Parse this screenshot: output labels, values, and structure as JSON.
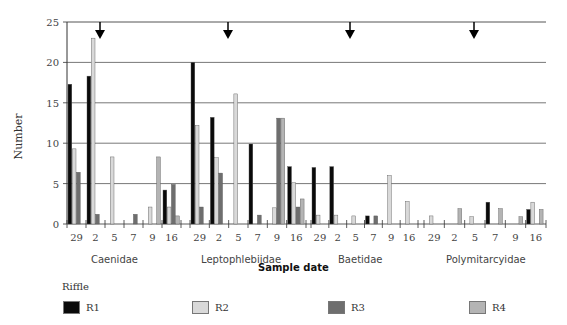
{
  "chart_data": {
    "type": "bar",
    "title": "",
    "xlabel": "Sample date",
    "ylabel": "Number",
    "ylim": [
      0,
      25
    ],
    "yticks": [
      0,
      5,
      10,
      15,
      20,
      25
    ],
    "grid": true,
    "legend": {
      "title": "Riffle",
      "position": "bottom",
      "entries": [
        "R1",
        "R2",
        "R3",
        "R4"
      ]
    },
    "series_colors": {
      "R1": "#0a0a0a",
      "R2": "#d9d9d9",
      "R3": "#6e6e6e",
      "R4": "#b4b4b4"
    },
    "annotations": [
      {
        "type": "arrow-down",
        "group": "Caenidae",
        "near_date": "2"
      },
      {
        "type": "arrow-down",
        "group": "Leptophlebiidae",
        "near_date": "2"
      },
      {
        "type": "arrow-down",
        "group": "Baetidae",
        "near_date": "2"
      },
      {
        "type": "arrow-down",
        "group": "Polymitarcyidae",
        "near_date": "2"
      }
    ],
    "groups": [
      {
        "name": "Caenidae",
        "dates": [
          "29",
          "2",
          "5",
          "7",
          "9",
          "16"
        ],
        "series": [
          {
            "name": "R1",
            "values": [
              17.3,
              18.3,
              0,
              0,
              0,
              4.2
            ]
          },
          {
            "name": "R2",
            "values": [
              9.3,
              23,
              8.3,
              0,
              2.1,
              2.1
            ]
          },
          {
            "name": "R3",
            "values": [
              6.4,
              1.2,
              0,
              1.2,
              0,
              4.9
            ]
          },
          {
            "name": "R4",
            "values": [
              0,
              0,
              0,
              0,
              8.3,
              1.0
            ]
          }
        ]
      },
      {
        "name": "Leptophlebiidae",
        "dates": [
          "29",
          "2",
          "5",
          "7",
          "9",
          "16"
        ],
        "series": [
          {
            "name": "R1",
            "values": [
              20,
              13.2,
              0,
              9.9,
              0,
              7.1
            ]
          },
          {
            "name": "R2",
            "values": [
              12.2,
              8.2,
              16.1,
              0,
              2.0,
              5.1
            ]
          },
          {
            "name": "R3",
            "values": [
              2.1,
              6.3,
              0,
              1.1,
              13.1,
              2.1
            ]
          },
          {
            "name": "R4",
            "values": [
              0,
              0,
              0,
              0,
              13.1,
              3.1
            ]
          }
        ]
      },
      {
        "name": "Baetidae",
        "dates": [
          "29",
          "2",
          "5",
          "7",
          "9",
          "16"
        ],
        "series": [
          {
            "name": "R1",
            "values": [
              7.0,
              7.1,
              0,
              1.0,
              0,
              0
            ]
          },
          {
            "name": "R2",
            "values": [
              1.1,
              1.1,
              1.0,
              0,
              6.0,
              2.8
            ]
          },
          {
            "name": "R3",
            "values": [
              0,
              0,
              0,
              1.0,
              0,
              0
            ]
          },
          {
            "name": "R4",
            "values": [
              0,
              0,
              0,
              0,
              0,
              0
            ]
          }
        ]
      },
      {
        "name": "Polymitarcyidae",
        "dates": [
          "29",
          "2",
          "5",
          "7",
          "9",
          "16"
        ],
        "series": [
          {
            "name": "R1",
            "values": [
              0,
              0,
              0,
              2.7,
              0,
              1.8
            ]
          },
          {
            "name": "R2",
            "values": [
              1.0,
              0,
              0.9,
              0,
              0,
              2.7
            ]
          },
          {
            "name": "R3",
            "values": [
              0,
              0,
              0,
              0,
              0,
              0
            ]
          },
          {
            "name": "R4",
            "values": [
              0,
              1.9,
              0,
              1.9,
              0.9,
              1.8
            ]
          }
        ]
      }
    ]
  },
  "labels": {
    "ylabel": "Number",
    "xtitle": "Sample date",
    "legend_title": "Riffle",
    "families": [
      "Caenidae",
      "Leptophlebiidae",
      "Baetidae",
      "Polymitarcyidae"
    ],
    "legend": [
      "R1",
      "R2",
      "R3",
      "R4"
    ]
  }
}
